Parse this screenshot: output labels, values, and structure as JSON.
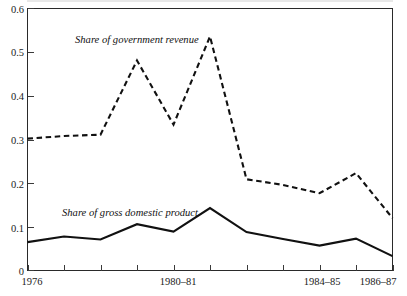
{
  "chart_data": {
    "type": "line",
    "title": "",
    "xlabel": "",
    "ylabel": "",
    "ylim": [
      0,
      0.6
    ],
    "grid": false,
    "legend_position": "inline-annotation",
    "x": [
      0,
      1,
      2,
      3,
      4,
      5,
      6,
      7,
      8,
      9,
      10
    ],
    "categories": [
      "1976",
      "",
      "",
      "",
      "1980-81",
      "",
      "",
      "",
      "1984-85",
      "",
      "1986-87"
    ],
    "xtick_labels": [
      "1976",
      "1980–81",
      "1984–85",
      "1986–87"
    ],
    "ytick_labels": [
      "0",
      "0.1",
      "0.2",
      "0.3",
      "0.4",
      "0.5",
      "0.6"
    ],
    "ytick_values": [
      0,
      0.1,
      0.2,
      0.3,
      0.4,
      0.5,
      0.6
    ],
    "series": [
      {
        "name": "Share of government revenue",
        "style": "dashed",
        "values": [
          0.302,
          0.308,
          0.311,
          0.481,
          0.334,
          0.536,
          0.209,
          0.196,
          0.177,
          0.223,
          0.12
        ]
      },
      {
        "name": "Share of gross domestic product",
        "style": "solid",
        "values": [
          0.065,
          0.078,
          0.071,
          0.106,
          0.089,
          0.143,
          0.088,
          0.072,
          0.057,
          0.073,
          0.033
        ]
      }
    ],
    "annotations": [
      {
        "text": "Share of government revenue",
        "series": "Share of government revenue",
        "x_px": 75,
        "y_px": 43
      },
      {
        "text": "Share of gross domestic product",
        "series": "Share of gross domestic product",
        "x_px": 62,
        "y_px": 216
      }
    ],
    "colors": {
      "line": "#111111",
      "axis": "#2a2a2a",
      "background": "#ffffff"
    }
  },
  "axes": {
    "y_ticks": [
      {
        "label": "0.6",
        "value": 0.6
      },
      {
        "label": "0.5",
        "value": 0.5
      },
      {
        "label": "0.4",
        "value": 0.4
      },
      {
        "label": "0.3",
        "value": 0.3
      },
      {
        "label": "0.2",
        "value": 0.2
      },
      {
        "label": "0.1",
        "value": 0.1
      },
      {
        "label": "0",
        "value": 0
      }
    ],
    "x_ticks": [
      {
        "label": "1976",
        "index": 0
      },
      {
        "label": "",
        "index": 1
      },
      {
        "label": "",
        "index": 2
      },
      {
        "label": "",
        "index": 3
      },
      {
        "label": "1980–81",
        "index": 4
      },
      {
        "label": "",
        "index": 5
      },
      {
        "label": "",
        "index": 6
      },
      {
        "label": "",
        "index": 7
      },
      {
        "label": "1984–85",
        "index": 8
      },
      {
        "label": "",
        "index": 9
      },
      {
        "label": "1986–87",
        "index": 10
      }
    ]
  }
}
